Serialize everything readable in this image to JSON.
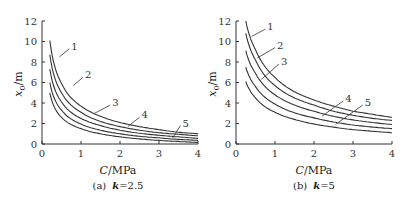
{
  "chart_data": [
    {
      "type": "line",
      "title": "",
      "caption": "(a)  k=2.5",
      "xlabel": "C/MPa",
      "ylabel": "x0/m",
      "xlim": [
        0,
        4
      ],
      "ylim": [
        0,
        12
      ],
      "xticks": [
        0,
        1,
        2,
        3,
        4
      ],
      "yticks": [
        0,
        2,
        4,
        6,
        8,
        10,
        12
      ],
      "grid": false,
      "legend": "inline numeric labels 1-5",
      "x": [
        0.2,
        0.5,
        1.0,
        1.5,
        2.0,
        2.5,
        3.0,
        3.5,
        4.0
      ],
      "series": [
        {
          "name": "1",
          "values": [
            10.1,
            5.9,
            3.7,
            2.7,
            2.1,
            1.7,
            1.4,
            1.15,
            1.0
          ]
        },
        {
          "name": "2",
          "values": [
            8.7,
            5.0,
            3.1,
            2.2,
            1.7,
            1.35,
            1.1,
            0.95,
            0.8
          ]
        },
        {
          "name": "3",
          "values": [
            7.3,
            4.1,
            2.5,
            1.8,
            1.35,
            1.05,
            0.85,
            0.7,
            0.55
          ]
        },
        {
          "name": "4",
          "values": [
            6.0,
            3.3,
            1.95,
            1.35,
            1.0,
            0.75,
            0.6,
            0.45,
            0.35
          ]
        },
        {
          "name": "5",
          "values": [
            5.0,
            2.6,
            1.5,
            1.0,
            0.7,
            0.5,
            0.35,
            0.25,
            0.15
          ]
        }
      ]
    },
    {
      "type": "line",
      "title": "",
      "caption": "(b)  k=5",
      "xlabel": "C/MPa",
      "ylabel": "x0/m",
      "xlim": [
        0,
        4
      ],
      "ylim": [
        0,
        12
      ],
      "xticks": [
        0,
        1,
        2,
        3,
        4
      ],
      "yticks": [
        0,
        2,
        4,
        6,
        8,
        10,
        12
      ],
      "grid": false,
      "legend": "inline numeric labels 1-5",
      "x": [
        0.25,
        0.5,
        1.0,
        1.5,
        2.0,
        2.5,
        3.0,
        3.5,
        4.0
      ],
      "series": [
        {
          "name": "1",
          "values": [
            12.0,
            9.2,
            6.5,
            5.1,
            4.3,
            3.7,
            3.2,
            2.9,
            2.6
          ]
        },
        {
          "name": "2",
          "values": [
            10.8,
            8.2,
            5.7,
            4.5,
            3.8,
            3.2,
            2.8,
            2.5,
            2.3
          ]
        },
        {
          "name": "3",
          "values": [
            9.1,
            6.9,
            4.8,
            3.8,
            3.2,
            2.7,
            2.35,
            2.1,
            1.9
          ]
        },
        {
          "name": "4",
          "values": [
            7.5,
            5.6,
            3.9,
            3.05,
            2.55,
            2.15,
            1.85,
            1.65,
            1.5
          ]
        },
        {
          "name": "5",
          "values": [
            6.1,
            4.5,
            3.1,
            2.4,
            1.95,
            1.65,
            1.4,
            1.25,
            1.1
          ]
        }
      ]
    }
  ],
  "labels": {
    "ylabel_main": "x",
    "ylabel_sub": "0",
    "ylabel_unit": "/m",
    "xlabel_c": "C",
    "xlabel_unit": "/MPa",
    "caption_a_prefix": "(a)",
    "caption_a_k": "k",
    "caption_a_val": "=2.5",
    "caption_b_prefix": "(b)",
    "caption_b_k": "k",
    "caption_b_val": "=5"
  }
}
